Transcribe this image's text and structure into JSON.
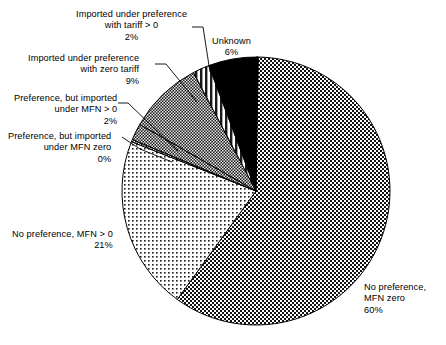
{
  "chart_data": {
    "type": "pie",
    "title": "",
    "subtitle": "",
    "xlabel": "",
    "ylabel": "",
    "legend_position": "none",
    "grid": false,
    "units": "percent",
    "categories": [
      "No preference, MFN zero",
      "No preference, MFN > 0",
      "Preference, but imported under MFN zero",
      "Preference, but imported under MFN > 0",
      "Imported under preference with zero tariff",
      "Imported under preference with tariff > 0",
      "Unknown"
    ],
    "values": [
      60,
      21,
      0,
      2,
      9,
      2,
      6
    ],
    "slices": [
      {
        "name": "No preference, MFN zero",
        "value": 60,
        "value_label": "60%",
        "pattern": "dense-dark-checker",
        "fill": "#151515",
        "label_lines": [
          "No preference,",
          "MFN zero",
          "60%"
        ],
        "label_align": "left",
        "label_x": 364,
        "label_y": 282,
        "leader": false
      },
      {
        "name": "No preference, MFN > 0",
        "value": 21,
        "value_label": "21%",
        "pattern": "light-dot",
        "fill": "#f2f2f2",
        "label_lines": [
          "No preference, MFN > 0",
          "21%"
        ],
        "label_align": "right",
        "label_x": 12,
        "label_y": 229,
        "leader": false
      },
      {
        "name": "Preference, but imported under MFN zero",
        "value": 0,
        "value_label": "0%",
        "pattern": "medium-checker",
        "fill": "#9a9a9a",
        "label_lines": [
          "Preference, but imported",
          "under MFN zero",
          "0%"
        ],
        "label_align": "right",
        "label_x": 8,
        "label_y": 131,
        "leader": true,
        "leader_path": "M 122,137 L 140,149 L 172,162"
      },
      {
        "name": "Preference, but imported under MFN > 0",
        "value": 2,
        "value_label": "2%",
        "pattern": "dark-checker",
        "fill": "#3b3b3b",
        "label_lines": [
          "Preference, but imported",
          "under MFN > 0",
          "2%"
        ],
        "label_align": "right",
        "label_x": 14,
        "label_y": 93,
        "leader": true,
        "leader_path": "M 118,103 L 128,103 L 178,151"
      },
      {
        "name": "Imported under preference with zero tariff",
        "value": 9,
        "value_label": "9%",
        "pattern": "dark-checker",
        "fill": "#2b2b2b",
        "label_lines": [
          "Imported under preference",
          "with zero tariff",
          "9%"
        ],
        "label_align": "right",
        "label_x": 28,
        "label_y": 53,
        "leader": true,
        "leader_path": "M 155,64 L 166,64 L 197,102"
      },
      {
        "name": "Imported under preference with tariff > 0",
        "value": 2,
        "value_label": "2%",
        "pattern": "vertical-stripes",
        "fill": "#dcdcdc",
        "label_lines": [
          "Imported under preference",
          "with tariff > 0",
          "2%"
        ],
        "label_align": "center",
        "label_x": 76,
        "label_y": 9,
        "leader": true,
        "leader_path": "M 192,27 L 203,27 L 210,72"
      },
      {
        "name": "Unknown",
        "value": 6,
        "value_label": "6%",
        "pattern": "solid-black",
        "fill": "#000000",
        "label_lines": [
          "Unknown",
          "6%"
        ],
        "label_align": "center",
        "label_x": 212,
        "label_y": 36,
        "leader": false
      }
    ],
    "geometry": {
      "center_x": 256,
      "center_y": 191,
      "radius": 134,
      "start_angle_deg": 0,
      "direction": "clockwise"
    }
  }
}
